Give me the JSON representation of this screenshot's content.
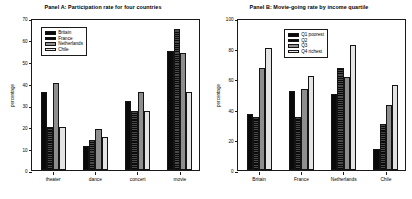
{
  "chart_data": [
    {
      "type": "bar",
      "panel": "A",
      "title": "Panel A: Participation rate for four countries",
      "xlabel": "",
      "ylabel": "percentage",
      "ylim": [
        0,
        70
      ],
      "yticks": [
        0,
        10,
        20,
        30,
        40,
        50,
        60,
        70
      ],
      "grid": false,
      "legend_position": "top-left",
      "categories": [
        "theater",
        "dance",
        "concert",
        "movie"
      ],
      "series": [
        {
          "name": "Britain",
          "fill": "f0",
          "values": [
            36,
            11,
            32,
            55
          ]
        },
        {
          "name": "France",
          "fill": "f1",
          "values": [
            20,
            14,
            27,
            65
          ]
        },
        {
          "name": "Netherlands",
          "fill": "f2",
          "values": [
            40,
            19,
            36,
            54
          ]
        },
        {
          "name": "Chile",
          "fill": "f3",
          "values": [
            20,
            15,
            27,
            36
          ]
        }
      ]
    },
    {
      "type": "bar",
      "panel": "B",
      "title": "Panel B: Movie-going rate by income quartile",
      "xlabel": "",
      "ylabel": "percentage",
      "ylim": [
        0,
        100
      ],
      "yticks": [
        0,
        20,
        40,
        60,
        80,
        100
      ],
      "grid": false,
      "legend_position": "top-center",
      "categories": [
        "Britain",
        "France",
        "Netherlands",
        "Chile"
      ],
      "series": [
        {
          "name": "Q1 poorest",
          "fill": "f0",
          "values": [
            37,
            52,
            50,
            14
          ]
        },
        {
          "name": "Q2",
          "fill": "f1",
          "values": [
            35,
            35,
            67,
            30
          ]
        },
        {
          "name": "Q3",
          "fill": "f2",
          "values": [
            67,
            53,
            61,
            43
          ]
        },
        {
          "name": "Q4 richest",
          "fill": "f3",
          "values": [
            80,
            62,
            82,
            56
          ]
        }
      ]
    }
  ]
}
